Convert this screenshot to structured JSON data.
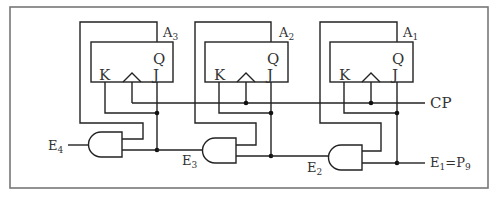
{
  "diagram": {
    "type": "digital logic circuit - JK flip-flop counter with AND gate enable chain",
    "clock_label": "CP",
    "flipflops": [
      {
        "name": "A",
        "sub": "3",
        "pins": {
          "q": "Q",
          "k": "K",
          "j": "J"
        }
      },
      {
        "name": "A",
        "sub": "2",
        "pins": {
          "q": "Q",
          "k": "K",
          "j": "J"
        }
      },
      {
        "name": "A",
        "sub": "1",
        "pins": {
          "q": "Q",
          "k": "K",
          "j": "J"
        }
      }
    ],
    "gates": [
      {
        "type": "AND",
        "output_label": "E",
        "output_sub": "4"
      },
      {
        "type": "AND",
        "output_label": "E",
        "output_sub": "3"
      },
      {
        "type": "AND",
        "output_label": "E",
        "output_sub": "2"
      }
    ],
    "input_label": {
      "e": "E",
      "e_sub": "1",
      "eq": "=",
      "p": "P",
      "p_sub": "9"
    }
  }
}
